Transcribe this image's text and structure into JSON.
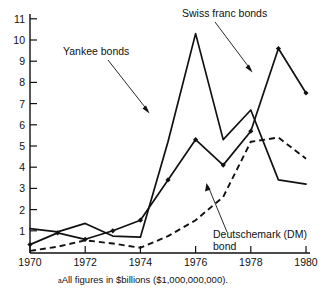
{
  "figure": {
    "footnote_marker": "a",
    "footnote": "All figures in $billions ($1,000,000,000)."
  },
  "annotations": {
    "yankee": {
      "label": "Yankee bonds"
    },
    "swiss": {
      "label": "Swiss franc bonds"
    },
    "dm_line1": {
      "label": "Deutschemark (DM)"
    },
    "dm_line2": {
      "label": "bond"
    }
  },
  "axes": {
    "y_ticks": [
      "1",
      "2",
      "3",
      "4",
      "5",
      "6",
      "7",
      "8",
      "9",
      "10",
      "11"
    ],
    "x_ticks": [
      "1970",
      "1972",
      "1974",
      "1976",
      "1978",
      "1980"
    ]
  },
  "chart_data": {
    "type": "line",
    "title": "",
    "subtitle": "",
    "xlabel": "",
    "ylabel": "",
    "xlim": [
      1970,
      1980
    ],
    "ylim": [
      0,
      11.5
    ],
    "grid": false,
    "legend": "annotations",
    "x": [
      1970,
      1971,
      1972,
      1973,
      1974,
      1975,
      1976,
      1977,
      1978,
      1979,
      1980
    ],
    "series": [
      {
        "name": "Swiss franc bonds",
        "style": "solid",
        "markers": false,
        "values": [
          1.1,
          0.95,
          1.35,
          0.75,
          0.7,
          5.2,
          10.3,
          5.3,
          6.7,
          3.4,
          3.2
        ]
      },
      {
        "name": "Yankee bonds",
        "style": "solid",
        "markers": "diamond",
        "values": [
          0.35,
          0.9,
          0.6,
          1.0,
          1.5,
          3.4,
          5.3,
          4.1,
          5.7,
          9.6,
          7.5
        ]
      },
      {
        "name": "Deutschemark (DM) bond",
        "style": "dashed",
        "markers": false,
        "values": [
          0.05,
          0.25,
          0.55,
          0.4,
          0.2,
          0.75,
          1.5,
          2.6,
          5.2,
          5.4,
          4.4
        ]
      }
    ]
  }
}
